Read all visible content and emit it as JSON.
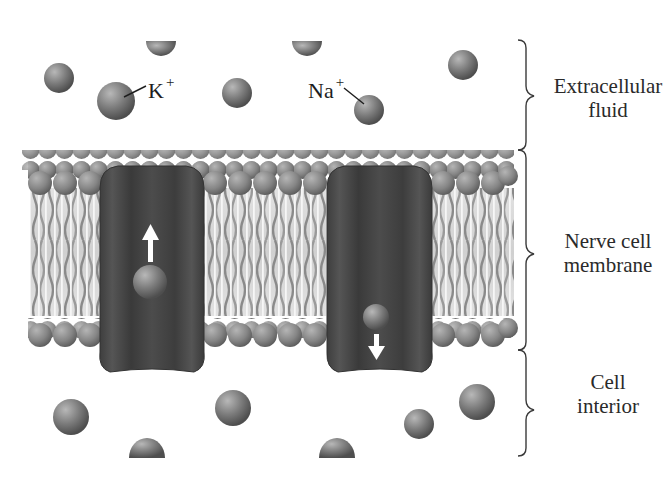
{
  "diagram": {
    "regions": [
      {
        "id": "extracellular",
        "label_line1": "Extracellular",
        "label_line2": "fluid"
      },
      {
        "id": "membrane",
        "label_line1": "Nerve cell",
        "label_line2": "membrane"
      },
      {
        "id": "interior",
        "label_line1": "Cell",
        "label_line2": "interior"
      }
    ],
    "ion_labels": {
      "potassium": {
        "symbol": "K",
        "charge": "+"
      },
      "sodium": {
        "symbol": "Na",
        "charge": "+"
      }
    },
    "channels": [
      {
        "id": "potassium-channel",
        "arrow_direction": "up"
      },
      {
        "id": "sodium-channel",
        "arrow_direction": "down"
      }
    ],
    "colors": {
      "ion": "#7a7a7a",
      "channel": "#4a4a4a",
      "lipid_head": "#8c8c8c",
      "lipid_tail": "#9a9a9a",
      "arrow": "#ffffff",
      "text": "#2a2a2a"
    }
  }
}
